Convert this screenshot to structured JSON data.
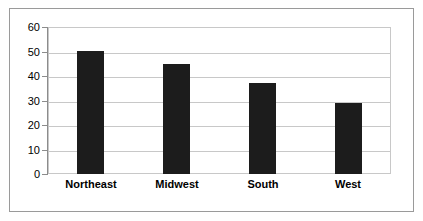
{
  "chart_data": {
    "type": "bar",
    "title": "",
    "subtitle": "",
    "xlabel": "",
    "ylabel": "",
    "categories": [
      "Northeast",
      "Midwest",
      "South",
      "West"
    ],
    "values": [
      50,
      45,
      37,
      29
    ],
    "ylim": [
      0,
      60
    ],
    "ytick_labels": [
      "0",
      "10",
      "20",
      "30",
      "40",
      "50",
      "60"
    ],
    "ytick_values": [
      0,
      10,
      20,
      30,
      40,
      50,
      60
    ],
    "grid": true,
    "grid_axis": "y",
    "legend": false,
    "legend_position": "none",
    "annotations": []
  },
  "style": {
    "bar_color": "#1c1c1c",
    "grid_color": "#c8c8c8",
    "axis_color": "#8c8c8c",
    "frame_color": "#9a9a9a",
    "background_color": "#ffffff",
    "text_color": "#000000"
  }
}
